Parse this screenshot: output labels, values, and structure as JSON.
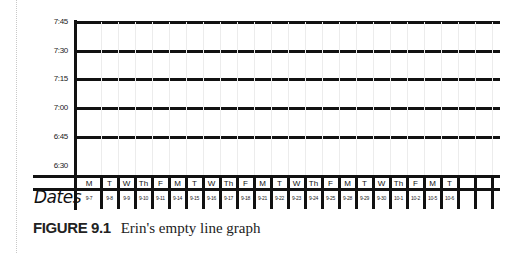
{
  "chart_data": {
    "type": "line",
    "title": "",
    "caption": {
      "label": "FIGURE 9.1",
      "text": "Erin's empty line graph"
    },
    "xlabel": "Dates",
    "ylabel": "",
    "y_ticks": [
      "7:45",
      "7:30",
      "7:15",
      "7:00",
      "6:45",
      "6:30"
    ],
    "ylim": [
      "6:30",
      "7:45"
    ],
    "grid": true,
    "legend": null,
    "days": [
      "M",
      "T",
      "W",
      "Th",
      "F",
      "M",
      "T",
      "W",
      "Th",
      "F",
      "M",
      "T",
      "W",
      "Th",
      "F",
      "M",
      "T",
      "W",
      "Th",
      "F",
      "M",
      "T",
      "",
      "",
      ""
    ],
    "categories": [
      "9-7",
      "9-8",
      "9-9",
      "9-10",
      "9-11",
      "9-14",
      "9-15",
      "9-16",
      "9-17",
      "9-18",
      "9-21",
      "9-22",
      "9-23",
      "9-24",
      "9-25",
      "9-28",
      "9-29",
      "9-30",
      "10-1",
      "10-2",
      "10-5",
      "10-6",
      "",
      "",
      ""
    ],
    "series": []
  }
}
